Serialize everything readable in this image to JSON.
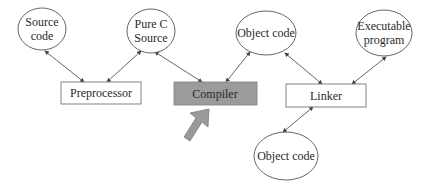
{
  "diagram": {
    "colors": {
      "stroke": "#555555",
      "text": "#2a2a2a",
      "compiler_fill": "#9b9b9b",
      "pointer_arrow_fill": "#9a9a9a"
    },
    "nodes": {
      "source_code": {
        "shape": "ellipse",
        "lines": [
          "Source",
          "code"
        ]
      },
      "pure_c_source": {
        "shape": "ellipse",
        "lines": [
          "Pure C",
          "Source"
        ]
      },
      "object_code_top": {
        "shape": "ellipse",
        "lines": [
          "Object code"
        ]
      },
      "executable_program": {
        "shape": "ellipse",
        "lines": [
          "Executable",
          "program"
        ]
      },
      "object_code_bottom": {
        "shape": "ellipse",
        "lines": [
          "Object code"
        ]
      },
      "preprocessor": {
        "shape": "rect",
        "label": "Preprocessor"
      },
      "compiler": {
        "shape": "rect",
        "label": "Compiler",
        "highlighted": true
      },
      "linker": {
        "shape": "rect",
        "label": "Linker"
      }
    },
    "edges": [
      {
        "from": "source_code",
        "to": "preprocessor",
        "bidirectional": true
      },
      {
        "from": "preprocessor",
        "to": "pure_c_source",
        "bidirectional": true
      },
      {
        "from": "pure_c_source",
        "to": "compiler",
        "bidirectional": true
      },
      {
        "from": "compiler",
        "to": "object_code_top",
        "bidirectional": true
      },
      {
        "from": "object_code_top",
        "to": "linker",
        "bidirectional": true
      },
      {
        "from": "linker",
        "to": "executable_program",
        "bidirectional": true
      },
      {
        "from": "object_code_bottom",
        "to": "linker",
        "bidirectional": true
      }
    ],
    "pointer": {
      "target": "compiler",
      "direction": "up-right"
    }
  }
}
